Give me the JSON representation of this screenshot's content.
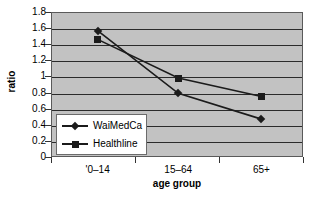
{
  "chart_data": {
    "type": "line",
    "title": "",
    "xlabel": "age group",
    "ylabel": "ratio",
    "categories": [
      "'0–14",
      "15–64",
      "65+"
    ],
    "series": [
      {
        "name": "WaiMedCa",
        "marker": "diamond",
        "values": [
          1.57,
          0.79,
          0.47
        ]
      },
      {
        "name": "Healthline",
        "marker": "square",
        "values": [
          1.46,
          0.98,
          0.75
        ]
      }
    ],
    "ylim": [
      0,
      1.8
    ],
    "ytick_labels": [
      "0",
      "0.2",
      "0.4",
      "0.6",
      "0.8",
      "1",
      "1.2",
      "1.4",
      "1.6",
      "1.8"
    ],
    "ytick_values": [
      0,
      0.2,
      0.4,
      0.6,
      0.8,
      1,
      1.2,
      1.4,
      1.6,
      1.8
    ],
    "grid": true,
    "grid_axis": "y",
    "legend_position": "inside-bottom-left",
    "colors": {
      "plot_background": "#c2c2c2",
      "gridline": "#2b2b2b",
      "series_line": "#1b1b1b",
      "axis": "#5a5a5a",
      "legend_background": "#ffffff",
      "text": "#000000"
    }
  },
  "axes": {
    "y_title": "ratio",
    "x_title": "age group"
  },
  "legend": {
    "items": [
      {
        "label": "WaiMedCa",
        "marker": "diamond-marker"
      },
      {
        "label": "Healthline",
        "marker": "square-marker"
      }
    ]
  }
}
